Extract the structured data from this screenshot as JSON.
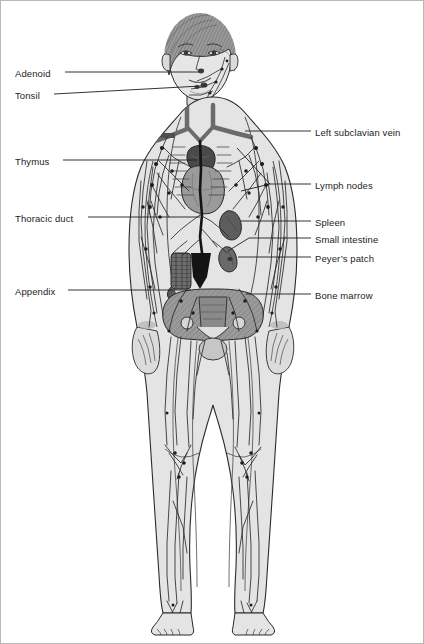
{
  "diagram": {
    "style": "grayscale medical line illustration",
    "background_color": "#ffffff",
    "border_color": "#b8b8b8",
    "ink_color": "#1d1d1d",
    "body_fill": "#e2e2e2",
    "organ_tones": {
      "thymus": "#4a4a4a",
      "heart": "#9a9a9a",
      "spleen": "#5d5d5d",
      "small_intestine": "#6a6a6a",
      "peyers_patch": "#5a5a5a",
      "bone_marrow": "#8c8c8c",
      "appendix": "#585858",
      "thoracic_duct": "#141414",
      "vessels": "#2a2a2a"
    }
  },
  "labels_left": [
    {
      "id": "adenoid",
      "text": "Adenoid",
      "text_x": 14,
      "text_y": 67,
      "line_x1": 64,
      "line_y1": 71,
      "line_x2": 198,
      "line_y2": 71
    },
    {
      "id": "tonsil",
      "text": "Tonsil",
      "text_x": 14,
      "text_y": 89,
      "line_x1": 53,
      "line_y1": 93,
      "line_x2": 200,
      "line_y2": 85
    },
    {
      "id": "thymus",
      "text": "Thymus",
      "text_x": 14,
      "text_y": 155,
      "line_x1": 62,
      "line_y1": 159,
      "line_x2": 196,
      "line_y2": 159
    },
    {
      "id": "thoracic-duct",
      "text": "Thoracic duct",
      "text_x": 14,
      "text_y": 212,
      "line_x1": 87,
      "line_y1": 216,
      "line_x2": 199,
      "line_y2": 216
    },
    {
      "id": "appendix",
      "text": "Appendix",
      "text_x": 14,
      "text_y": 285,
      "line_x1": 67,
      "line_y1": 289,
      "line_x2": 190,
      "line_y2": 289
    }
  ],
  "labels_right": [
    {
      "id": "left-subclavian-vein",
      "text": "Left subclavian vein",
      "text_x": 314,
      "text_y": 126,
      "line_x1": 310,
      "line_y1": 130,
      "line_x2": 244,
      "line_y2": 130
    },
    {
      "id": "lymph-nodes",
      "text": "Lymph nodes",
      "text_x": 314,
      "text_y": 179,
      "line_x1": 310,
      "line_y1": 183,
      "line_x2": 269,
      "line_y2": 183,
      "fork": [
        {
          "x1": 269,
          "y1": 183,
          "x2": 236,
          "y2": 147
        },
        {
          "x1": 269,
          "y1": 183,
          "x2": 240,
          "y2": 190
        }
      ]
    },
    {
      "id": "spleen",
      "text": "Spleen",
      "text_x": 314,
      "text_y": 216,
      "line_x1": 310,
      "line_y1": 220,
      "line_x2": 240,
      "line_y2": 220
    },
    {
      "id": "small-intestine",
      "text": "Small intestine",
      "text_x": 314,
      "text_y": 233,
      "line_x1": 310,
      "line_y1": 237,
      "line_x2": 248,
      "line_y2": 237,
      "fork": [
        {
          "x1": 248,
          "y1": 237,
          "x2": 227,
          "y2": 250
        }
      ]
    },
    {
      "id": "peyers-patch",
      "text": "Peyer’s patch",
      "text_x": 314,
      "text_y": 252,
      "line_x1": 310,
      "line_y1": 256,
      "line_x2": 237,
      "line_y2": 256
    },
    {
      "id": "bone-marrow",
      "text": "Bone marrow",
      "text_x": 314,
      "text_y": 289,
      "line_x1": 310,
      "line_y1": 293,
      "line_x2": 245,
      "line_y2": 293
    }
  ],
  "anatomy_parts": [
    "head",
    "hair",
    "face",
    "neck",
    "torso",
    "arms",
    "hands",
    "pelvis",
    "legs",
    "knees",
    "feet",
    "thymus",
    "heart",
    "spleen",
    "small-intestine",
    "peyers-patch",
    "appendix",
    "bone-marrow",
    "thoracic-duct",
    "subclavian-vein",
    "lymphatic-vessels",
    "lymph-nodes"
  ]
}
